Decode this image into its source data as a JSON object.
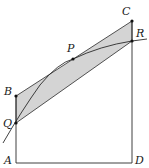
{
  "diagram": {
    "points": {
      "A": {
        "label": "A",
        "x": 16,
        "y": 163
      },
      "B": {
        "label": "B",
        "x": 16,
        "y": 96
      },
      "Q": {
        "label": "Q",
        "x": 16,
        "y": 123
      },
      "P": {
        "label": "P",
        "x": 73,
        "y": 59
      },
      "C": {
        "label": "C",
        "x": 132,
        "y": 21
      },
      "R": {
        "label": "R",
        "x": 132,
        "y": 41
      },
      "D": {
        "label": "D",
        "x": 132,
        "y": 163
      }
    },
    "colors": {
      "shade": "#d4d4d4",
      "line": "#2a2a2a"
    }
  }
}
